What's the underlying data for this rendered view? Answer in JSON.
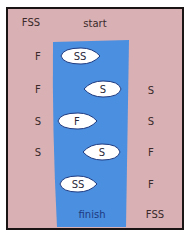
{
  "diagram": {
    "start_label": "start",
    "finish_label": "finish",
    "colors": {
      "bank": "#d9b0b3",
      "river": "#4a8fe0",
      "border": "#1a1414",
      "boat": "#ffffff"
    },
    "left_bank": [
      "FSS",
      "F",
      "F",
      "S",
      "S",
      "",
      ""
    ],
    "right_bank": [
      "",
      "",
      "S",
      "S",
      "F",
      "F",
      "FSS"
    ],
    "boats": [
      "SS",
      "S",
      "F",
      "S",
      "SS"
    ]
  }
}
